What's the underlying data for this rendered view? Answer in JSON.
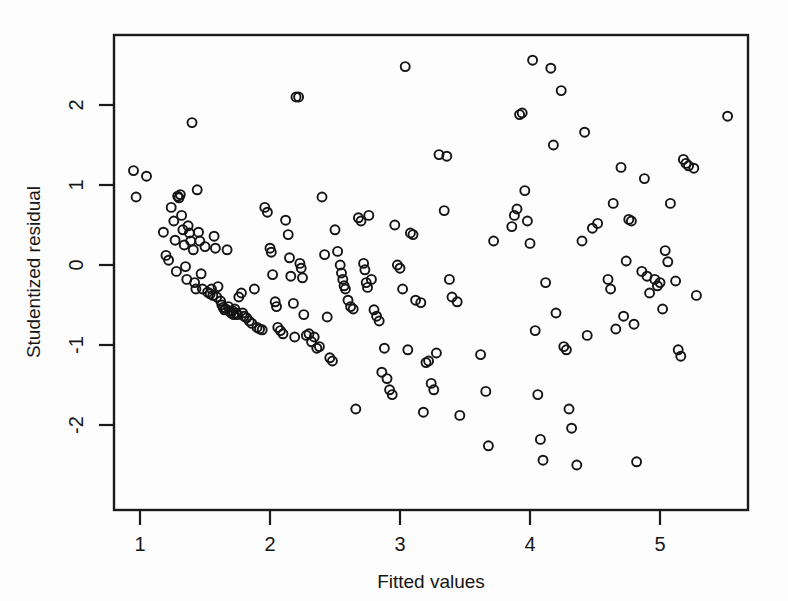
{
  "chart_data": {
    "type": "scatter",
    "title": "",
    "subtitle": "",
    "xlabel": "Fitted values",
    "ylabel": "Studentized residual",
    "xlim": [
      0.87,
      5.62
    ],
    "ylim": [
      -2.73,
      2.74
    ],
    "xticks": [
      1,
      2,
      3,
      4,
      5
    ],
    "xtick_labels": [
      "1",
      "2",
      "3",
      "4",
      "5"
    ],
    "yticks": [
      -2,
      -1,
      0,
      1,
      2
    ],
    "ytick_labels": [
      "-2",
      "-1",
      "0",
      "1",
      "2"
    ],
    "grid": false,
    "legend": null,
    "legend_position": "none",
    "marker": "open-circle",
    "marker_color": "#141414",
    "marker_size_px": 9,
    "background_color": "#fdfdfd",
    "frame_color": "#1b1b1b",
    "n_points": 216,
    "series": [
      {
        "name": "residuals",
        "points": [
          [
            0.95,
            1.18
          ],
          [
            0.97,
            0.85
          ],
          [
            1.05,
            1.11
          ],
          [
            1.18,
            0.41
          ],
          [
            1.2,
            0.12
          ],
          [
            1.22,
            0.06
          ],
          [
            1.24,
            0.72
          ],
          [
            1.26,
            0.55
          ],
          [
            1.27,
            0.31
          ],
          [
            1.28,
            -0.08
          ],
          [
            1.29,
            0.86
          ],
          [
            1.3,
            0.84
          ],
          [
            1.31,
            0.88
          ],
          [
            1.32,
            0.62
          ],
          [
            1.33,
            0.44
          ],
          [
            1.34,
            0.25
          ],
          [
            1.35,
            -0.02
          ],
          [
            1.36,
            -0.18
          ],
          [
            1.37,
            0.49
          ],
          [
            1.38,
            0.4
          ],
          [
            1.39,
            0.3
          ],
          [
            1.4,
            1.78
          ],
          [
            1.41,
            0.19
          ],
          [
            1.42,
            -0.22
          ],
          [
            1.43,
            -0.3
          ],
          [
            1.44,
            0.94
          ],
          [
            1.45,
            0.41
          ],
          [
            1.46,
            0.3
          ],
          [
            1.47,
            -0.11
          ],
          [
            1.48,
            -0.3
          ],
          [
            1.5,
            0.23
          ],
          [
            1.52,
            -0.34
          ],
          [
            1.54,
            -0.36
          ],
          [
            1.55,
            -0.3
          ],
          [
            1.56,
            -0.38
          ],
          [
            1.57,
            0.36
          ],
          [
            1.58,
            0.21
          ],
          [
            1.59,
            -0.4
          ],
          [
            1.6,
            -0.27
          ],
          [
            1.62,
            -0.45
          ],
          [
            1.63,
            -0.5
          ],
          [
            1.64,
            -0.53
          ],
          [
            1.65,
            -0.56
          ],
          [
            1.66,
            -0.55
          ],
          [
            1.67,
            0.19
          ],
          [
            1.68,
            -0.52
          ],
          [
            1.69,
            -0.58
          ],
          [
            1.7,
            -0.6
          ],
          [
            1.71,
            -0.57
          ],
          [
            1.72,
            -0.62
          ],
          [
            1.73,
            -0.55
          ],
          [
            1.74,
            -0.6
          ],
          [
            1.75,
            -0.62
          ],
          [
            1.76,
            -0.4
          ],
          [
            1.78,
            -0.35
          ],
          [
            1.79,
            -0.6
          ],
          [
            1.8,
            -0.64
          ],
          [
            1.82,
            -0.66
          ],
          [
            1.84,
            -0.7
          ],
          [
            1.86,
            -0.73
          ],
          [
            1.88,
            -0.3
          ],
          [
            1.9,
            -0.78
          ],
          [
            1.92,
            -0.8
          ],
          [
            1.94,
            -0.81
          ],
          [
            1.96,
            0.72
          ],
          [
            1.98,
            0.66
          ],
          [
            2.0,
            0.21
          ],
          [
            2.01,
            0.16
          ],
          [
            2.02,
            -0.12
          ],
          [
            2.04,
            -0.46
          ],
          [
            2.05,
            -0.52
          ],
          [
            2.06,
            -0.78
          ],
          [
            2.08,
            -0.82
          ],
          [
            2.1,
            -0.86
          ],
          [
            2.12,
            0.56
          ],
          [
            2.14,
            0.38
          ],
          [
            2.15,
            0.09
          ],
          [
            2.16,
            -0.14
          ],
          [
            2.18,
            -0.48
          ],
          [
            2.19,
            -0.9
          ],
          [
            2.2,
            2.1
          ],
          [
            2.22,
            2.1
          ],
          [
            2.23,
            0.02
          ],
          [
            2.24,
            -0.04
          ],
          [
            2.25,
            -0.16
          ],
          [
            2.26,
            -0.62
          ],
          [
            2.28,
            -0.88
          ],
          [
            2.3,
            -0.86
          ],
          [
            2.32,
            -0.96
          ],
          [
            2.34,
            -0.9
          ],
          [
            2.36,
            -1.04
          ],
          [
            2.38,
            -1.02
          ],
          [
            2.4,
            0.85
          ],
          [
            2.42,
            0.13
          ],
          [
            2.44,
            -0.65
          ],
          [
            2.46,
            -1.16
          ],
          [
            2.48,
            -1.2
          ],
          [
            2.5,
            0.44
          ],
          [
            2.52,
            0.17
          ],
          [
            2.54,
            0.0
          ],
          [
            2.55,
            -0.1
          ],
          [
            2.56,
            -0.18
          ],
          [
            2.57,
            -0.26
          ],
          [
            2.58,
            -0.3
          ],
          [
            2.6,
            -0.44
          ],
          [
            2.62,
            -0.52
          ],
          [
            2.64,
            -0.55
          ],
          [
            2.66,
            -1.8
          ],
          [
            2.68,
            0.59
          ],
          [
            2.7,
            0.55
          ],
          [
            2.72,
            0.02
          ],
          [
            2.73,
            -0.06
          ],
          [
            2.74,
            -0.22
          ],
          [
            2.75,
            -0.28
          ],
          [
            2.76,
            0.62
          ],
          [
            2.78,
            -0.18
          ],
          [
            2.8,
            -0.56
          ],
          [
            2.82,
            -0.64
          ],
          [
            2.84,
            -0.7
          ],
          [
            2.86,
            -1.34
          ],
          [
            2.88,
            -1.04
          ],
          [
            2.9,
            -1.42
          ],
          [
            2.92,
            -1.56
          ],
          [
            2.94,
            -1.62
          ],
          [
            2.96,
            0.5
          ],
          [
            2.98,
            0.0
          ],
          [
            3.0,
            -0.04
          ],
          [
            3.02,
            -0.3
          ],
          [
            3.04,
            2.48
          ],
          [
            3.06,
            -1.06
          ],
          [
            3.08,
            0.4
          ],
          [
            3.1,
            0.38
          ],
          [
            3.12,
            -0.44
          ],
          [
            3.16,
            -0.47
          ],
          [
            3.18,
            -1.84
          ],
          [
            3.2,
            -1.22
          ],
          [
            3.22,
            -1.2
          ],
          [
            3.24,
            -1.48
          ],
          [
            3.26,
            -1.56
          ],
          [
            3.28,
            -1.1
          ],
          [
            3.3,
            1.38
          ],
          [
            3.34,
            0.68
          ],
          [
            3.36,
            1.36
          ],
          [
            3.38,
            -0.18
          ],
          [
            3.4,
            -0.4
          ],
          [
            3.44,
            -0.46
          ],
          [
            3.46,
            -1.88
          ],
          [
            3.62,
            -1.12
          ],
          [
            3.66,
            -1.58
          ],
          [
            3.68,
            -2.26
          ],
          [
            3.72,
            0.3
          ],
          [
            3.86,
            0.48
          ],
          [
            3.88,
            0.62
          ],
          [
            3.9,
            0.7
          ],
          [
            3.92,
            1.88
          ],
          [
            3.94,
            1.9
          ],
          [
            3.96,
            0.93
          ],
          [
            3.98,
            0.55
          ],
          [
            4.0,
            0.27
          ],
          [
            4.02,
            2.56
          ],
          [
            4.04,
            -0.82
          ],
          [
            4.06,
            -1.62
          ],
          [
            4.08,
            -2.18
          ],
          [
            4.1,
            -2.44
          ],
          [
            4.12,
            -0.22
          ],
          [
            4.16,
            2.46
          ],
          [
            4.18,
            1.5
          ],
          [
            4.2,
            -0.6
          ],
          [
            4.24,
            2.18
          ],
          [
            4.26,
            -1.02
          ],
          [
            4.28,
            -1.06
          ],
          [
            4.3,
            -1.8
          ],
          [
            4.32,
            -2.04
          ],
          [
            4.36,
            -2.5
          ],
          [
            4.4,
            0.3
          ],
          [
            4.42,
            1.66
          ],
          [
            4.44,
            -0.88
          ],
          [
            4.48,
            0.46
          ],
          [
            4.52,
            0.52
          ],
          [
            4.6,
            -0.18
          ],
          [
            4.62,
            -0.3
          ],
          [
            4.64,
            0.77
          ],
          [
            4.66,
            -0.8
          ],
          [
            4.7,
            1.22
          ],
          [
            4.72,
            -0.64
          ],
          [
            4.74,
            0.05
          ],
          [
            4.76,
            0.57
          ],
          [
            4.78,
            0.55
          ],
          [
            4.8,
            -0.74
          ],
          [
            4.82,
            -2.46
          ],
          [
            4.86,
            -0.08
          ],
          [
            4.88,
            1.08
          ],
          [
            4.9,
            -0.14
          ],
          [
            4.92,
            -0.35
          ],
          [
            4.96,
            -0.18
          ],
          [
            4.98,
            -0.26
          ],
          [
            5.0,
            -0.22
          ],
          [
            5.02,
            -0.55
          ],
          [
            5.04,
            0.18
          ],
          [
            5.06,
            0.04
          ],
          [
            5.08,
            0.77
          ],
          [
            5.12,
            -0.2
          ],
          [
            5.14,
            -1.06
          ],
          [
            5.16,
            -1.14
          ],
          [
            5.18,
            1.32
          ],
          [
            5.2,
            1.27
          ],
          [
            5.22,
            1.24
          ],
          [
            5.26,
            1.21
          ],
          [
            5.28,
            -0.38
          ],
          [
            5.52,
            1.86
          ]
        ]
      }
    ]
  },
  "axes": {
    "x_label": "Fitted values",
    "y_label": "Studentized residual",
    "x_tick_1": "1",
    "x_tick_2": "2",
    "x_tick_3": "3",
    "x_tick_4": "4",
    "x_tick_5": "5",
    "y_tick_n2": "-2",
    "y_tick_n1": "-1",
    "y_tick_0": "0",
    "y_tick_1": "1",
    "y_tick_2": "2"
  }
}
